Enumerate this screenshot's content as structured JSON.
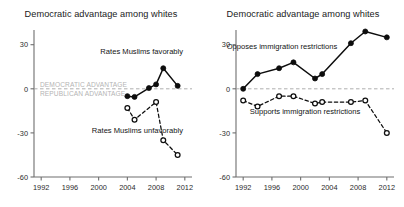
{
  "figure": {
    "background": "#ffffff",
    "panel_count": 2
  },
  "panels": [
    {
      "id": "left",
      "title": "Democratic advantage among whites",
      "zero_labels": {
        "above": "DEMOCRATIC ADVANTAGE",
        "below": "REPUBLICAN ADVANTAGE",
        "color": "#b4b4b4"
      },
      "annotations": [
        {
          "text": "Rates Muslims favorably",
          "x": 2006.0,
          "y": 24
        },
        {
          "text": "Rates Muslims unfavorably",
          "x": 2005.4,
          "y": -30
        }
      ]
    },
    {
      "id": "right",
      "title": "Democratic advantage among whites",
      "annotations": [
        {
          "text": "Opposes immigration restrictions",
          "x": 1997.4,
          "y": 27
        },
        {
          "text": "Supports immigration restrictions",
          "x": 2000.6,
          "y": -17
        }
      ]
    }
  ],
  "chart_data": [
    {
      "type": "line",
      "panel": "left",
      "title": "Democratic advantage among whites",
      "xlabel": "",
      "ylabel": "",
      "xlim": [
        1991,
        2013
      ],
      "ylim": [
        -60,
        40
      ],
      "xticks": [
        1992,
        1996,
        2000,
        2004,
        2008,
        2012
      ],
      "xticklabels": [
        "1992",
        "1996",
        "2000",
        "2004",
        "2008",
        "2012"
      ],
      "yticks": [
        30,
        0,
        -30,
        -60
      ],
      "yticklabels": [
        "30",
        "0",
        "-30",
        "-60"
      ],
      "grid": false,
      "legend": "annotations-inline",
      "zero_reference_line": true,
      "series": [
        {
          "name": "Rates Muslims favorably",
          "style": "solid",
          "marker": "filled-circle",
          "color": "#0d0d0d",
          "x": [
            2004,
            2005,
            2007,
            2008,
            2009,
            2011
          ],
          "y": [
            -5,
            -5.5,
            0.5,
            3,
            14,
            2
          ]
        },
        {
          "name": "Rates Muslims unfavorably",
          "style": "dashed",
          "marker": "open-circle",
          "color": "#0d0d0d",
          "x": [
            2004,
            2005,
            2008,
            2009,
            2011
          ],
          "y": [
            -13,
            -21,
            -9,
            -35,
            -45
          ]
        }
      ]
    },
    {
      "type": "line",
      "panel": "right",
      "title": "Democratic advantage among whites",
      "xlabel": "",
      "ylabel": "",
      "xlim": [
        1991,
        2013
      ],
      "ylim": [
        -60,
        40
      ],
      "xticks": [
        1992,
        1996,
        2000,
        2004,
        2008,
        2012
      ],
      "xticklabels": [
        "1992",
        "1996",
        "2000",
        "2004",
        "2008",
        "2012"
      ],
      "yticks": [
        30,
        0,
        -30,
        -60
      ],
      "yticklabels": [
        "30",
        "0",
        "-30",
        "-60"
      ],
      "grid": false,
      "legend": "annotations-inline",
      "zero_reference_line": true,
      "series": [
        {
          "name": "Opposes immigration restrictions",
          "style": "solid",
          "marker": "filled-circle",
          "color": "#0d0d0d",
          "x": [
            1992,
            1994,
            1997,
            1999,
            2002,
            2003,
            2007,
            2009,
            2012
          ],
          "y": [
            0,
            10,
            14,
            18,
            7,
            10,
            31,
            39,
            35
          ]
        },
        {
          "name": "Supports immigration restrictions",
          "style": "dashed",
          "marker": "open-circle",
          "color": "#0d0d0d",
          "x": [
            1992,
            1994,
            1997,
            1999,
            2002,
            2003,
            2007,
            2009,
            2012
          ],
          "y": [
            -8,
            -12,
            -5,
            -5,
            -10,
            -9,
            -9,
            -8,
            -30
          ]
        }
      ]
    }
  ]
}
